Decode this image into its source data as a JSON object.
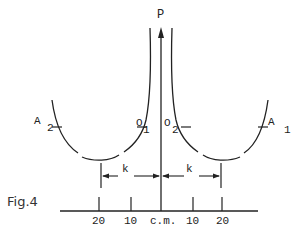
{
  "figure": {
    "caption": "Fig.4",
    "axis_label": "P",
    "colors": {
      "ink": "#222222",
      "background": "#ffffff"
    },
    "points": {
      "A2": {
        "letter": "A",
        "sub": "2"
      },
      "O1": {
        "letter": "O",
        "sub": "1"
      },
      "O2": {
        "letter": "O",
        "sub": "2"
      },
      "A1": {
        "letter": "A",
        "sub": "1"
      }
    },
    "distances": {
      "left": "k",
      "right": "k"
    },
    "scale": {
      "ticks": [
        "20",
        "10",
        "c.m.",
        "10",
        "20"
      ]
    }
  }
}
